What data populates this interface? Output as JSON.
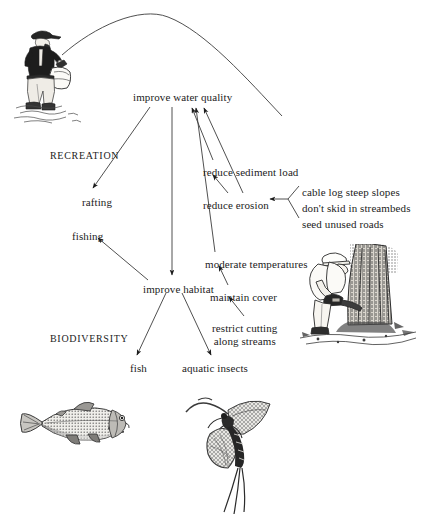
{
  "diagram": {
    "background_color": "#ffffff",
    "ink_color": "#1c1c1c",
    "groups": [
      {
        "id": "recreation",
        "label": "RECREATION",
        "x": 50,
        "y": 150
      },
      {
        "id": "biodiversity",
        "label": "BIODIVERSITY",
        "x": 50,
        "y": 333
      }
    ],
    "nodes": [
      {
        "id": "improve-water-quality",
        "label": "improve water quality",
        "x": 133,
        "y": 91
      },
      {
        "id": "rafting",
        "label": "rafting",
        "x": 82,
        "y": 196
      },
      {
        "id": "fishing",
        "label": "fishing",
        "x": 72,
        "y": 230
      },
      {
        "id": "reduce-sediment-load",
        "label": "reduce sediment load",
        "x": 203,
        "y": 166
      },
      {
        "id": "reduce-erosion",
        "label": "reduce erosion",
        "x": 203,
        "y": 199
      },
      {
        "id": "cable-log-steep-slopes",
        "label": "cable log steep slopes",
        "x": 302,
        "y": 186
      },
      {
        "id": "dont-skid-in-streambeds",
        "label": "don't skid in streambeds",
        "x": 302,
        "y": 202
      },
      {
        "id": "seed-unused-roads",
        "label": "seed unused roads",
        "x": 302,
        "y": 218
      },
      {
        "id": "moderate-temperatures",
        "label": "moderate temperatures",
        "x": 205,
        "y": 258
      },
      {
        "id": "maintain-cover",
        "label": "maintain cover",
        "x": 210,
        "y": 291
      },
      {
        "id": "restrict-cutting-along-streams",
        "label": "restrict cutting\nalong streams",
        "x": 212,
        "y": 322
      },
      {
        "id": "improve-habitat",
        "label": "improve habitat",
        "x": 143,
        "y": 283
      },
      {
        "id": "fish",
        "label": "fish",
        "x": 130,
        "y": 362
      },
      {
        "id": "aquatic-insects",
        "label": "aquatic insects",
        "x": 182,
        "y": 362
      }
    ],
    "edges": [
      {
        "id": "edge-water-to-rafting",
        "from": "improve water quality",
        "to": "rafting",
        "arrow": "to"
      },
      {
        "id": "edge-water-to-habitat",
        "from": "improve water quality",
        "to": "improve habitat",
        "arrow": "to"
      },
      {
        "id": "edge-sediment-to-water",
        "from": "reduce sediment load",
        "to": "improve water quality",
        "arrow": "to"
      },
      {
        "id": "edge-erosion-to-water",
        "from": "reduce erosion",
        "to": "improve water quality",
        "arrow": "to"
      },
      {
        "id": "edge-erosion-to-sediment",
        "from": "reduce erosion",
        "to": "reduce sediment load",
        "arrow": "to"
      },
      {
        "id": "edge-practices-to-erosion",
        "from": "cable log steep slopes / don't skid in streambeds / seed unused roads",
        "to": "reduce erosion",
        "arrow": "to"
      },
      {
        "id": "edge-temperatures-to-water",
        "from": "moderate temperatures",
        "to": "improve water quality",
        "arrow": "to"
      },
      {
        "id": "edge-cover-to-temperatures",
        "from": "maintain cover",
        "to": "moderate temperatures",
        "arrow": "to"
      },
      {
        "id": "edge-restrict-to-cover",
        "from": "restrict cutting along streams",
        "to": "maintain cover",
        "arrow": "to"
      },
      {
        "id": "edge-habitat-to-fishing",
        "from": "improve habitat",
        "to": "fishing",
        "arrow": "to"
      },
      {
        "id": "edge-habitat-to-fish",
        "from": "improve habitat",
        "to": "fish",
        "arrow": "to"
      },
      {
        "id": "edge-habitat-to-insects",
        "from": "improve habitat",
        "to": "aquatic insects",
        "arrow": "to"
      }
    ],
    "illustrations": [
      {
        "id": "fly-fisher",
        "name": "fly-fisherman-wading-illustration",
        "x": 14,
        "y": 24,
        "width": 68,
        "height": 98
      },
      {
        "id": "logger",
        "name": "logger-felling-tree-illustration",
        "x": 300,
        "y": 246,
        "width": 118,
        "height": 108
      },
      {
        "id": "trout",
        "name": "trout-illustration",
        "x": 22,
        "y": 394,
        "width": 104,
        "height": 70
      },
      {
        "id": "mayfly",
        "name": "mayfly-illustration",
        "x": 186,
        "y": 392,
        "width": 96,
        "height": 122
      }
    ]
  }
}
